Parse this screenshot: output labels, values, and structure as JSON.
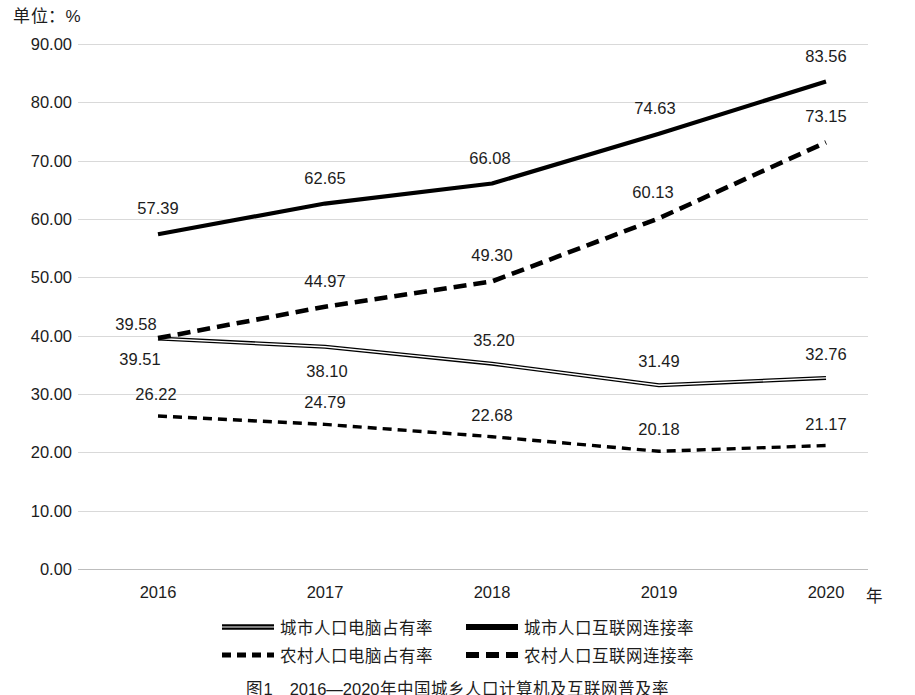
{
  "unit_label": "单位：%",
  "x_axis_title": "年",
  "caption": "图1　2016—2020年中国城乡人口计算机及互联网普及率",
  "axis": {
    "y_ticks": [
      "90.00",
      "80.00",
      "70.00",
      "60.00",
      "50.00",
      "40.00",
      "30.00",
      "20.00",
      "10.00",
      "0.00"
    ],
    "x_ticks": [
      "2016",
      "2017",
      "2018",
      "2019",
      "2020"
    ]
  },
  "colors": {
    "line": "#000000",
    "grid": "#d9d9d9",
    "text": "#1c1c1c",
    "background": "#ffffff"
  },
  "legend": {
    "row1": [
      {
        "label": "城市人口电脑占有率",
        "style": "double-solid"
      },
      {
        "label": "城市人口互联网连接率",
        "style": "thick-solid"
      }
    ],
    "row2": [
      {
        "label": "农村人口电脑占有率",
        "style": "thin-dashed"
      },
      {
        "label": "农村人口互联网连接率",
        "style": "thick-dashed"
      }
    ]
  },
  "chart_data": {
    "type": "line",
    "title": "",
    "xlabel": "年",
    "ylabel": "单位：%",
    "ylim": [
      0,
      90
    ],
    "ytick_step": 10,
    "grid": true,
    "legend_position": "bottom",
    "categories": [
      "2016",
      "2017",
      "2018",
      "2019",
      "2020"
    ],
    "series": [
      {
        "name": "城市人口电脑占有率",
        "style": "double-solid",
        "values": [
          39.51,
          38.1,
          35.2,
          31.49,
          32.76
        ],
        "labels": [
          "39.51",
          "38.10",
          "35.20",
          "31.49",
          "32.76"
        ]
      },
      {
        "name": "城市人口互联网连接率",
        "style": "thick-solid",
        "values": [
          57.39,
          62.65,
          66.08,
          74.63,
          83.56
        ],
        "labels": [
          "57.39",
          "62.65",
          "66.08",
          "74.63",
          "83.56"
        ]
      },
      {
        "name": "农村人口电脑占有率",
        "style": "thin-dashed",
        "values": [
          26.22,
          24.79,
          22.68,
          20.18,
          21.17
        ],
        "labels": [
          "26.22",
          "24.79",
          "22.68",
          "20.18",
          "21.17"
        ]
      },
      {
        "name": "农村人口互联网连接率",
        "style": "thick-dashed",
        "values": [
          39.58,
          44.97,
          49.3,
          60.13,
          73.15
        ],
        "labels": [
          "39.58",
          "44.97",
          "49.30",
          "60.13",
          "73.15"
        ]
      }
    ]
  }
}
